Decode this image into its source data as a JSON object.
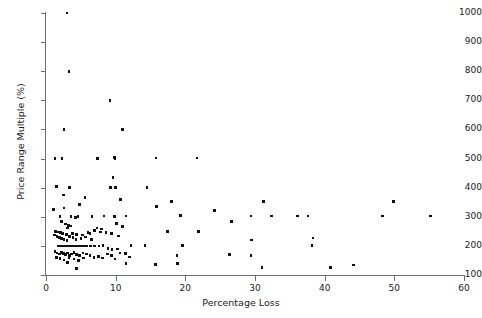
{
  "chart_data": {
    "type": "scatter",
    "title": "",
    "xlabel": "Percentage Loss",
    "ylabel": "Price Range Multiple (%)",
    "xlim": [
      0,
      60
    ],
    "ylim": [
      100,
      1000
    ],
    "xticks": [
      0,
      10,
      20,
      30,
      40,
      50,
      60
    ],
    "yticks": [
      100,
      200,
      300,
      400,
      500,
      600,
      700,
      800,
      900,
      1000
    ],
    "xtick_labels": [
      "0",
      "10",
      "20",
      "30",
      "40",
      "50",
      "60"
    ],
    "ytick_labels": [
      "100",
      "200",
      "300",
      "400",
      "500",
      "600",
      "700",
      "800",
      "900",
      "1000"
    ],
    "grid": false,
    "legend": null,
    "marker": "square",
    "marker_color": "#111111",
    "axis_color": "#6e6e6e",
    "background": "#ffffff",
    "n_points": 151,
    "points": [
      [
        3.0,
        1000
      ],
      [
        3.3,
        800
      ],
      [
        9.2,
        700
      ],
      [
        2.6,
        600
      ],
      [
        11.0,
        600
      ],
      [
        1.3,
        500
      ],
      [
        2.3,
        500
      ],
      [
        7.4,
        500
      ],
      [
        9.8,
        503
      ],
      [
        9.9,
        498
      ],
      [
        15.8,
        502
      ],
      [
        21.7,
        502
      ],
      [
        9.6,
        435
      ],
      [
        1.5,
        403
      ],
      [
        3.4,
        400
      ],
      [
        9.3,
        400
      ],
      [
        10.0,
        400
      ],
      [
        14.5,
        400
      ],
      [
        2.5,
        375
      ],
      [
        5.6,
        367
      ],
      [
        10.7,
        360
      ],
      [
        18.0,
        352
      ],
      [
        31.2,
        352
      ],
      [
        49.9,
        352
      ],
      [
        4.8,
        342
      ],
      [
        15.9,
        335
      ],
      [
        2.6,
        330
      ],
      [
        1.1,
        325
      ],
      [
        2.0,
        300
      ],
      [
        3.6,
        300
      ],
      [
        4.2,
        298
      ],
      [
        4.6,
        300
      ],
      [
        6.6,
        300
      ],
      [
        8.3,
        302
      ],
      [
        9.8,
        301
      ],
      [
        11.5,
        302
      ],
      [
        19.3,
        305
      ],
      [
        24.2,
        322
      ],
      [
        26.6,
        283
      ],
      [
        29.4,
        302
      ],
      [
        32.4,
        302
      ],
      [
        36.1,
        302
      ],
      [
        37.6,
        303
      ],
      [
        48.3,
        303
      ],
      [
        55.2,
        303
      ],
      [
        2.2,
        284
      ],
      [
        2.8,
        275
      ],
      [
        10.1,
        276
      ],
      [
        3.2,
        270
      ],
      [
        3.5,
        268
      ],
      [
        11.0,
        266
      ],
      [
        7.3,
        262
      ],
      [
        8.0,
        258
      ],
      [
        3.1,
        262
      ],
      [
        1.4,
        250
      ],
      [
        1.8,
        248
      ],
      [
        2.1,
        245
      ],
      [
        2.4,
        242
      ],
      [
        2.9,
        240
      ],
      [
        3.8,
        243
      ],
      [
        4.4,
        240
      ],
      [
        5.2,
        238
      ],
      [
        6.0,
        247
      ],
      [
        6.3,
        243
      ],
      [
        7.0,
        252
      ],
      [
        7.8,
        248
      ],
      [
        8.6,
        245
      ],
      [
        9.4,
        243
      ],
      [
        10.4,
        234
      ],
      [
        17.4,
        250
      ],
      [
        21.9,
        250
      ],
      [
        38.3,
        227
      ],
      [
        1.2,
        238
      ],
      [
        1.6,
        232
      ],
      [
        1.9,
        228
      ],
      [
        2.2,
        225
      ],
      [
        2.6,
        222
      ],
      [
        3.0,
        218
      ],
      [
        3.4,
        233
      ],
      [
        3.9,
        228
      ],
      [
        4.3,
        222
      ],
      [
        5.0,
        226
      ],
      [
        5.7,
        230
      ],
      [
        6.5,
        222
      ],
      [
        12.2,
        202
      ],
      [
        14.2,
        202
      ],
      [
        19.6,
        201
      ],
      [
        29.5,
        220
      ],
      [
        38.2,
        202
      ],
      [
        1.7,
        200
      ],
      [
        2.0,
        200
      ],
      [
        2.3,
        200
      ],
      [
        2.5,
        200
      ],
      [
        2.8,
        200
      ],
      [
        3.1,
        200
      ],
      [
        3.4,
        200
      ],
      [
        3.7,
        200
      ],
      [
        4.0,
        200
      ],
      [
        4.3,
        200
      ],
      [
        4.6,
        200
      ],
      [
        4.9,
        200
      ],
      [
        5.2,
        200
      ],
      [
        5.5,
        200
      ],
      [
        5.9,
        200
      ],
      [
        6.4,
        200
      ],
      [
        7.0,
        200
      ],
      [
        7.6,
        200
      ],
      [
        8.2,
        201
      ],
      [
        8.9,
        192
      ],
      [
        9.5,
        187
      ],
      [
        10.3,
        190
      ],
      [
        1.3,
        180
      ],
      [
        1.6,
        176
      ],
      [
        1.9,
        172
      ],
      [
        2.2,
        178
      ],
      [
        2.5,
        174
      ],
      [
        2.8,
        170
      ],
      [
        3.1,
        175
      ],
      [
        3.4,
        168
      ],
      [
        3.7,
        172
      ],
      [
        4.0,
        178
      ],
      [
        4.4,
        170
      ],
      [
        4.8,
        168
      ],
      [
        5.3,
        176
      ],
      [
        5.8,
        172
      ],
      [
        6.3,
        168
      ],
      [
        6.9,
        160
      ],
      [
        7.5,
        163
      ],
      [
        8.1,
        158
      ],
      [
        8.8,
        172
      ],
      [
        9.4,
        168
      ],
      [
        9.9,
        155
      ],
      [
        10.6,
        176
      ],
      [
        11.4,
        174
      ],
      [
        12.0,
        162
      ],
      [
        18.8,
        168
      ],
      [
        26.3,
        170
      ],
      [
        29.4,
        167
      ],
      [
        1.5,
        160
      ],
      [
        2.0,
        157
      ],
      [
        2.6,
        152
      ],
      [
        3.3,
        160
      ],
      [
        4.0,
        155
      ],
      [
        4.7,
        150
      ],
      [
        5.4,
        158
      ],
      [
        3.1,
        143
      ],
      [
        4.4,
        122
      ],
      [
        11.5,
        140
      ],
      [
        15.7,
        136
      ],
      [
        18.9,
        140
      ],
      [
        31.0,
        125
      ],
      [
        40.8,
        126
      ],
      [
        44.1,
        135
      ]
    ]
  },
  "axes": {
    "x_axis_name": "Percentage Loss",
    "y_axis_name": "Price Range Multiple (%)"
  }
}
